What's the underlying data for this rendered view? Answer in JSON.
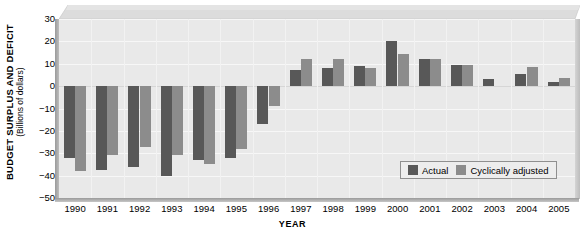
{
  "chart_data": {
    "type": "bar",
    "title": "BUDGET SURPLUS AND DEFICIT",
    "subtitle": "(Billions of dollars)",
    "xlabel": "YEAR",
    "ylabel": "BUDGET SURPLUS AND DEFICIT",
    "ylabel_units": "(Billions of dollars)",
    "ylim": [
      -50,
      30
    ],
    "ytick_step": 10,
    "yticks": [
      30,
      20,
      10,
      0,
      -10,
      -20,
      -30,
      -40,
      -50
    ],
    "ytick_labels": [
      "30",
      "20",
      "10",
      "0",
      "−10",
      "−20",
      "−30",
      "−40",
      "−50"
    ],
    "grid": true,
    "legend_position": "inside-bottom-right",
    "categories": [
      "1990",
      "1991",
      "1992",
      "1993",
      "1994",
      "1995",
      "1996",
      "1997",
      "1998",
      "1999",
      "2000",
      "2001",
      "2002",
      "2003",
      "2004",
      "2005"
    ],
    "series": [
      {
        "name": "Actual",
        "color": "#585858",
        "values": [
          -32,
          -37.5,
          -36,
          -40,
          -33,
          -32,
          -17,
          7,
          8,
          9,
          20,
          12,
          9.5,
          3,
          5.5,
          2
        ]
      },
      {
        "name": "Cyclically adjusted",
        "color": "#8c8c8c",
        "values": [
          -38,
          -31,
          -27,
          -31,
          -35,
          -28,
          -9,
          12,
          12,
          8,
          14.5,
          12,
          9.5,
          null,
          8.5,
          3.5
        ]
      }
    ]
  },
  "legend": {
    "items": [
      {
        "label": "Actual",
        "swatch": "actual"
      },
      {
        "label": "Cyclically adjusted",
        "swatch": "cyclic"
      }
    ]
  }
}
